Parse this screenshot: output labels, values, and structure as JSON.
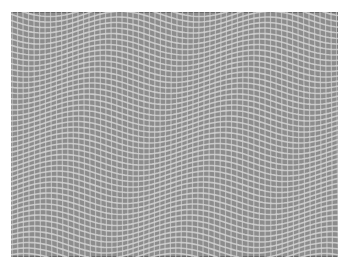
{
  "image": {
    "subject": "wavy woven mesh / grid texture",
    "colors": {
      "background": "#ffffff",
      "mesh_fill": "#8c8c8c",
      "mesh_lines": "#d4d4d4",
      "frame_edge": "#6a6a6a"
    },
    "grid": {
      "cell_size_px": 5.5,
      "wave_wavelength_px": 150,
      "wave_amplitude_px": 8
    }
  }
}
